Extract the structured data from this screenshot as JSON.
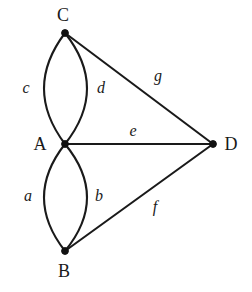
{
  "figure": {
    "name": "multigraph-diagram",
    "background_color": "#ffffff",
    "stroke_color": "#1a1a1a",
    "node_color": "#111111"
  },
  "chart_data": {
    "type": "diagram",
    "title": "",
    "subtitle": "",
    "xlabel": "",
    "ylabel": "",
    "graph_kind": "undirected multigraph",
    "vertices": [
      {
        "id": "C",
        "label": "C",
        "x": 65,
        "y": 33,
        "label_x": 63,
        "label_y": 15
      },
      {
        "id": "A",
        "label": "A",
        "x": 65,
        "y": 144,
        "label_x": 40,
        "label_y": 144
      },
      {
        "id": "B",
        "label": "B",
        "x": 65,
        "y": 251,
        "label_x": 64,
        "label_y": 271
      },
      {
        "id": "D",
        "label": "D",
        "x": 213,
        "y": 144,
        "label_x": 231,
        "label_y": 144
      }
    ],
    "edges": [
      {
        "id": "c",
        "label": "c",
        "from": "C",
        "to": "A",
        "shape": "arc",
        "bulge": -22,
        "label_x": 26,
        "label_y": 88
      },
      {
        "id": "d",
        "label": "d",
        "from": "C",
        "to": "A",
        "shape": "arc",
        "bulge": 21,
        "label_x": 101,
        "label_y": 88
      },
      {
        "id": "a",
        "label": "a",
        "from": "A",
        "to": "B",
        "shape": "arc",
        "bulge": -22,
        "label_x": 28,
        "label_y": 196
      },
      {
        "id": "b",
        "label": "b",
        "from": "A",
        "to": "B",
        "shape": "arc",
        "bulge": 21,
        "label_x": 99,
        "label_y": 196
      },
      {
        "id": "e",
        "label": "e",
        "from": "A",
        "to": "D",
        "shape": "line",
        "bulge": 0,
        "label_x": 133,
        "label_y": 131
      },
      {
        "id": "g",
        "label": "g",
        "from": "C",
        "to": "D",
        "shape": "line",
        "bulge": 0,
        "label_x": 158,
        "label_y": 76
      },
      {
        "id": "f",
        "label": "f",
        "from": "B",
        "to": "D",
        "shape": "line",
        "bulge": 0,
        "label_x": 155,
        "label_y": 207
      }
    ],
    "vertex_count": 4,
    "edge_count": 7,
    "multi_edges": [
      [
        "C",
        "A"
      ],
      [
        "A",
        "B"
      ]
    ],
    "legend": [],
    "annotations": []
  }
}
